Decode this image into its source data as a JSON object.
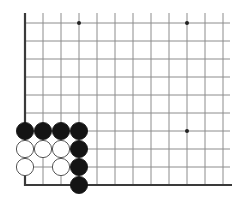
{
  "diagram": {
    "type": "go-board-corner",
    "colors": {
      "background": "#ffffff",
      "grid_line": "#8c8c8c",
      "edge_line": "#3a3a3a",
      "black_stone": "#141414",
      "white_stone": "#ffffff",
      "white_stroke": "#555555",
      "star_point": "#222222"
    },
    "grid": {
      "origin_x": 25,
      "origin_y": 185,
      "spacing": 18,
      "cols": 12,
      "rows": 10,
      "right_extent": 230,
      "top_extent": 13
    },
    "star_points": [
      {
        "col": 3,
        "row": 9
      },
      {
        "col": 9,
        "row": 9
      },
      {
        "col": 9,
        "row": 3
      }
    ],
    "stones": [
      {
        "color": "black",
        "col": 0,
        "row": 3
      },
      {
        "color": "black",
        "col": 1,
        "row": 3
      },
      {
        "color": "black",
        "col": 2,
        "row": 3
      },
      {
        "color": "black",
        "col": 3,
        "row": 3
      },
      {
        "color": "white",
        "col": 0,
        "row": 2
      },
      {
        "color": "white",
        "col": 1,
        "row": 2
      },
      {
        "color": "white",
        "col": 2,
        "row": 2
      },
      {
        "color": "black",
        "col": 3,
        "row": 2
      },
      {
        "color": "white",
        "col": 0,
        "row": 1
      },
      {
        "color": "white",
        "col": 2,
        "row": 1
      },
      {
        "color": "black",
        "col": 3,
        "row": 1
      },
      {
        "color": "black",
        "col": 3,
        "row": 0
      }
    ]
  }
}
